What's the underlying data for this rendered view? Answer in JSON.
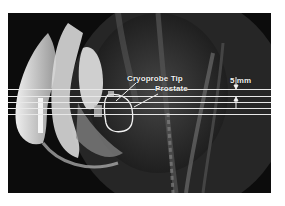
{
  "figure": {
    "annotations": {
      "cryoprobe_tip": "Cryoprobe Tip",
      "prostate": "Prostate",
      "scale": "5 mm"
    },
    "slice_lines_count": 5,
    "colors": {
      "background": "#0c0c0c",
      "annotation": "#f2f2f2",
      "page": "#ffffff"
    }
  }
}
